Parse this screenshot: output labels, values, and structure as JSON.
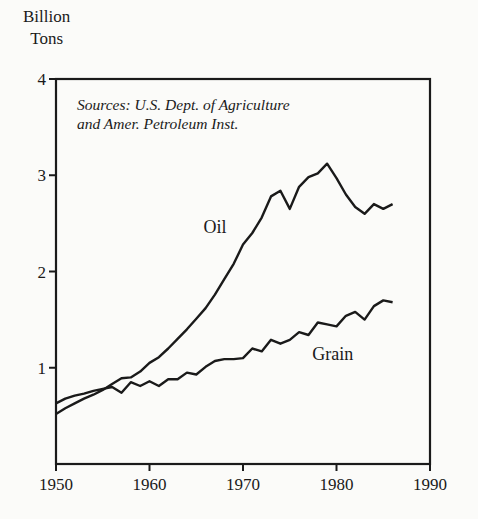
{
  "chart_data": {
    "type": "line",
    "title": "",
    "ylabel": "Billion Tons",
    "xlabel": "",
    "ylabel_lines": [
      "Billion",
      "Tons"
    ],
    "xlim": [
      1950,
      1990
    ],
    "ylim": [
      0,
      4
    ],
    "x_ticks": [
      1950,
      1960,
      1970,
      1980,
      1990
    ],
    "y_ticks": [
      1,
      2,
      3,
      4
    ],
    "grid": false,
    "legend": "inline labels",
    "annotation": [
      "Sources: U.S. Dept. of Agriculture",
      "and Amer. Petroleum Inst."
    ],
    "x": [
      1950,
      1951,
      1952,
      1953,
      1954,
      1955,
      1956,
      1957,
      1958,
      1959,
      1960,
      1961,
      1962,
      1963,
      1964,
      1965,
      1966,
      1967,
      1968,
      1969,
      1970,
      1971,
      1972,
      1973,
      1974,
      1975,
      1976,
      1977,
      1978,
      1979,
      1980,
      1981,
      1982,
      1983,
      1984,
      1985,
      1986
    ],
    "series": [
      {
        "name": "Oil",
        "label_position": {
          "x": 1967.0,
          "y": 2.4
        },
        "values": [
          0.52,
          0.58,
          0.63,
          0.68,
          0.72,
          0.77,
          0.83,
          0.89,
          0.9,
          0.96,
          1.05,
          1.11,
          1.2,
          1.3,
          1.4,
          1.51,
          1.62,
          1.76,
          1.92,
          2.08,
          2.28,
          2.4,
          2.56,
          2.78,
          2.84,
          2.65,
          2.88,
          2.98,
          3.02,
          3.12,
          2.97,
          2.8,
          2.67,
          2.6,
          2.7,
          2.65,
          2.7
        ]
      },
      {
        "name": "Grain",
        "label_position": {
          "x": 1979.6,
          "y": 1.08
        },
        "values": [
          0.63,
          0.68,
          0.71,
          0.73,
          0.76,
          0.78,
          0.8,
          0.74,
          0.85,
          0.81,
          0.86,
          0.81,
          0.88,
          0.88,
          0.95,
          0.93,
          1.01,
          1.07,
          1.09,
          1.09,
          1.1,
          1.2,
          1.17,
          1.29,
          1.25,
          1.29,
          1.37,
          1.34,
          1.47,
          1.45,
          1.43,
          1.54,
          1.58,
          1.5,
          1.64,
          1.7,
          1.68
        ]
      }
    ]
  }
}
